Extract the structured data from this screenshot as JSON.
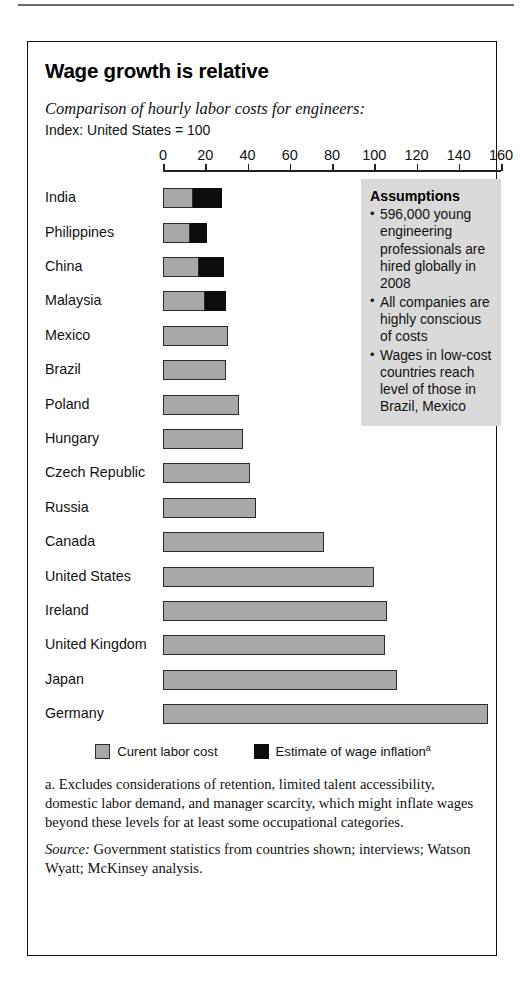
{
  "chart_data": {
    "type": "bar",
    "orientation": "horizontal",
    "stacked": true,
    "title": "Wage growth is relative",
    "subtitle": "Comparison of hourly labor costs for engineers:",
    "index_note": "Index: United States = 100",
    "xlabel": "",
    "ylabel": "",
    "xlim": [
      0,
      160
    ],
    "xticks": [
      0,
      20,
      40,
      60,
      80,
      100,
      120,
      140,
      160
    ],
    "grid": false,
    "legend_position": "bottom-center",
    "categories": [
      "India",
      "Philippines",
      "China",
      "Malaysia",
      "Mexico",
      "Brazil",
      "Poland",
      "Hungary",
      "Czech Republic",
      "Russia",
      "Canada",
      "United States",
      "Ireland",
      "United Kingdom",
      "Japan",
      "Germany"
    ],
    "series": [
      {
        "name": "Curent labor cost",
        "color": "#a8a8a8",
        "values": [
          14,
          13,
          17,
          20,
          31,
          30,
          36,
          38,
          41,
          44,
          76,
          100,
          106,
          105,
          111,
          154
        ]
      },
      {
        "name": "Estimate of wage inflation",
        "color": "#0d0d0d",
        "values": [
          14,
          8,
          12,
          10,
          0,
          0,
          0,
          0,
          0,
          0,
          0,
          0,
          0,
          0,
          0,
          0
        ]
      }
    ],
    "totals": [
      28,
      21,
      29,
      30,
      31,
      30,
      36,
      38,
      41,
      44,
      76,
      100,
      106,
      105,
      111,
      154
    ]
  },
  "legend": {
    "items": [
      {
        "label": "Curent labor cost",
        "marker": "gray-square",
        "sup": ""
      },
      {
        "label": "Estimate of wage inflation",
        "marker": "black-square",
        "sup": "a"
      }
    ]
  },
  "assumptions": {
    "heading": "Assumptions",
    "items": [
      "596,000 young engineering professionals are hired globally in 2008",
      "All companies are highly conscious of costs",
      "Wages in low-cost countries reach level of those in Brazil, Mexico"
    ]
  },
  "notes": {
    "footnote": "a. Excludes considerations of retention, limited talent accessibility, domestic labor demand, and manager scarcity, which might inflate wages beyond these levels for at least some occupational categories.",
    "source_label": "Source:",
    "source_text": "Government statistics from countries shown; interviews; Watson Wyatt; McKinsey analysis."
  },
  "colors": {
    "base_bar": "#a8a8a8",
    "inflation_bar": "#0d0d0d",
    "assumptions_box": "#d9d9d9",
    "frame": "#111111"
  }
}
